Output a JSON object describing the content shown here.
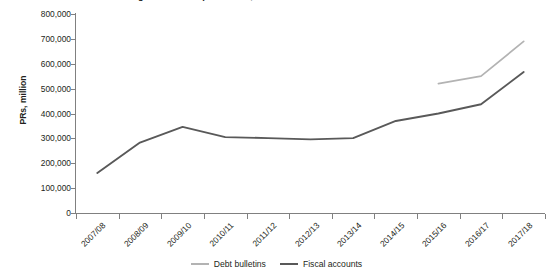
{
  "chart_data": {
    "type": "line",
    "title": "Figure: Pakistan public debt, debt bulletins versus fiscal accounts",
    "xlabel": "",
    "ylabel": "PRs, million",
    "categories": [
      "2007/08",
      "2008/09",
      "2009/10",
      "2010/11",
      "2011/12",
      "2012/13",
      "2013/14",
      "2014/15",
      "2015/16",
      "2016/17",
      "2017/18"
    ],
    "ylim": [
      0,
      800000
    ],
    "ytick_labels": [
      "0",
      "100,000",
      "200,000",
      "300,000",
      "400,000",
      "500,000",
      "600,000",
      "700,000",
      "800,000"
    ],
    "ytick_values": [
      0,
      100000,
      200000,
      300000,
      400000,
      500000,
      600000,
      700000,
      800000
    ],
    "ytick_step": 100000,
    "grid": false,
    "legend_position": "bottom-center",
    "series": [
      {
        "name": "Debt bulletins",
        "color": "#b3b3b3",
        "values": [
          null,
          null,
          null,
          null,
          null,
          null,
          null,
          null,
          520000,
          550000,
          690000
        ]
      },
      {
        "name": "Fiscal accounts",
        "color": "#595959",
        "values": [
          161000,
          283000,
          346000,
          305000,
          301000,
          296000,
          301000,
          370000,
          400000,
          437000,
          567000
        ]
      }
    ]
  },
  "axes": {
    "y_axis_title": "PRs, million"
  },
  "legend": {
    "entries": [
      {
        "label": "Debt bulletins",
        "color": "#b3b3b3"
      },
      {
        "label": "Fiscal accounts",
        "color": "#595959"
      }
    ]
  }
}
